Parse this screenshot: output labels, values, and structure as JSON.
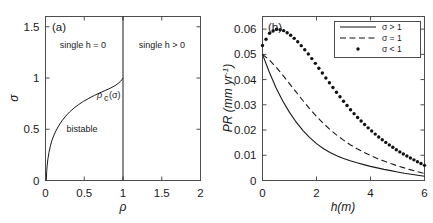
{
  "figure": {
    "panels": [
      {
        "id": "a",
        "label": "(a)",
        "xlabel": "ρ",
        "ylabel": "σ",
        "xticks": [
          "0",
          "0.5",
          "1",
          "1.5",
          "2"
        ],
        "yticks": [
          "0",
          "0.5",
          "1",
          "1.5"
        ],
        "annotations": {
          "upper_left": "single h = 0",
          "upper_right": "single h > 0",
          "lower_left": "bistable",
          "curve": "ρ",
          "curve_sub": "c",
          "curve_arg": "(σ)"
        }
      },
      {
        "id": "b",
        "label": "(b)",
        "xlabel": "h(m)",
        "ylabel": "PR (mm yr",
        "ylabel_exp": "-1",
        "ylabel_tail": ")",
        "xticks": [
          "0",
          "2",
          "4",
          "6"
        ],
        "yticks": [
          "0",
          "0.01",
          "0.02",
          "0.03",
          "0.04",
          "0.05",
          "0.06"
        ],
        "legend": [
          {
            "style": "solid",
            "label": "σ > 1"
          },
          {
            "style": "dashed",
            "label": "σ = 1"
          },
          {
            "style": "dotted",
            "label": "σ < 1"
          }
        ]
      }
    ]
  },
  "chart_data": [
    {
      "type": "line",
      "panel": "a",
      "title": "(a)",
      "xlabel": "ρ",
      "ylabel": "σ",
      "xlim": [
        0,
        2
      ],
      "ylim": [
        0,
        1.6
      ],
      "xticks": [
        0,
        0.5,
        1,
        1.5,
        2
      ],
      "yticks": [
        0,
        0.5,
        1,
        1.5
      ],
      "grid": false,
      "legend_position": "none",
      "annotations": [
        {
          "text": "single h = 0",
          "x": 0.44,
          "y": 1.32
        },
        {
          "text": "single h > 0",
          "x": 1.5,
          "y": 1.32
        },
        {
          "text": "bistable",
          "x": 0.42,
          "y": 0.5
        },
        {
          "text": "ρc (σ)",
          "x": 0.7,
          "y": 0.88
        }
      ],
      "series": [
        {
          "name": "ρc(σ) critical boundary",
          "style": "solid",
          "x": [
            0.01,
            0.015,
            0.022,
            0.032,
            0.045,
            0.062,
            0.085,
            0.11,
            0.14,
            0.175,
            0.215,
            0.26,
            0.31,
            0.365,
            0.425,
            0.49,
            0.56,
            0.63,
            0.7,
            0.77,
            0.835,
            0.89,
            0.935,
            0.968,
            0.988,
            1.0
          ],
          "y": [
            0.0,
            0.085,
            0.15,
            0.215,
            0.275,
            0.335,
            0.395,
            0.445,
            0.492,
            0.54,
            0.585,
            0.628,
            0.668,
            0.705,
            0.74,
            0.772,
            0.802,
            0.83,
            0.855,
            0.878,
            0.9,
            0.922,
            0.945,
            0.968,
            0.986,
            1.0
          ]
        },
        {
          "name": "ρ = 1 vertical boundary",
          "style": "solid",
          "x": [
            1.0,
            1.0
          ],
          "y": [
            0.0,
            1.6
          ]
        }
      ]
    },
    {
      "type": "line",
      "panel": "b",
      "title": "(b)",
      "xlabel": "h(m)",
      "ylabel": "PR (mm yr-1)",
      "xlim": [
        0,
        6
      ],
      "ylim": [
        0,
        0.065
      ],
      "xticks": [
        0,
        2,
        4,
        6
      ],
      "yticks": [
        0,
        0.01,
        0.02,
        0.03,
        0.04,
        0.05,
        0.06
      ],
      "grid": false,
      "legend_position": "upper right",
      "series": [
        {
          "name": "σ > 1",
          "style": "solid",
          "x": [
            0.0,
            0.25,
            0.5,
            0.75,
            1.0,
            1.25,
            1.5,
            1.75,
            2.0,
            2.25,
            2.5,
            2.75,
            3.0,
            3.25,
            3.5,
            3.75,
            4.0,
            4.25,
            4.5,
            4.75,
            5.0,
            5.25,
            5.5,
            5.75,
            6.0
          ],
          "y": [
            0.05,
            0.043,
            0.0368,
            0.0315,
            0.027,
            0.0231,
            0.0198,
            0.017,
            0.0146,
            0.0127,
            0.0111,
            0.0098,
            0.0087,
            0.0078,
            0.007,
            0.0063,
            0.0056,
            0.005,
            0.0044,
            0.0039,
            0.0034,
            0.0029,
            0.0025,
            0.0021,
            0.0017
          ]
        },
        {
          "name": "σ = 1",
          "style": "dashed",
          "x": [
            0.0,
            0.25,
            0.5,
            0.75,
            1.0,
            1.25,
            1.5,
            1.75,
            2.0,
            2.25,
            2.5,
            2.75,
            3.0,
            3.25,
            3.5,
            3.75,
            4.0,
            4.25,
            4.5,
            4.75,
            5.0,
            5.25,
            5.5,
            5.75,
            6.0
          ],
          "y": [
            0.05,
            0.0478,
            0.045,
            0.0418,
            0.0384,
            0.035,
            0.0316,
            0.0284,
            0.0254,
            0.0227,
            0.0202,
            0.018,
            0.016,
            0.0142,
            0.0126,
            0.0112,
            0.0099,
            0.0087,
            0.0077,
            0.0067,
            0.0058,
            0.005,
            0.0042,
            0.0035,
            0.0028
          ]
        },
        {
          "name": "σ < 1",
          "style": "dotted",
          "x": [
            0.0,
            0.25,
            0.5,
            0.75,
            1.0,
            1.25,
            1.5,
            1.75,
            2.0,
            2.25,
            2.5,
            2.75,
            3.0,
            3.25,
            3.5,
            3.75,
            4.0,
            4.25,
            4.5,
            4.75,
            5.0,
            5.25,
            5.5,
            5.75,
            6.0
          ],
          "y": [
            0.0535,
            0.0583,
            0.06,
            0.0596,
            0.058,
            0.0556,
            0.0527,
            0.0494,
            0.0458,
            0.0421,
            0.0384,
            0.0348,
            0.0314,
            0.0282,
            0.0252,
            0.0225,
            0.02,
            0.0177,
            0.0156,
            0.0137,
            0.0119,
            0.0103,
            0.0088,
            0.0074,
            0.006
          ]
        }
      ]
    }
  ]
}
